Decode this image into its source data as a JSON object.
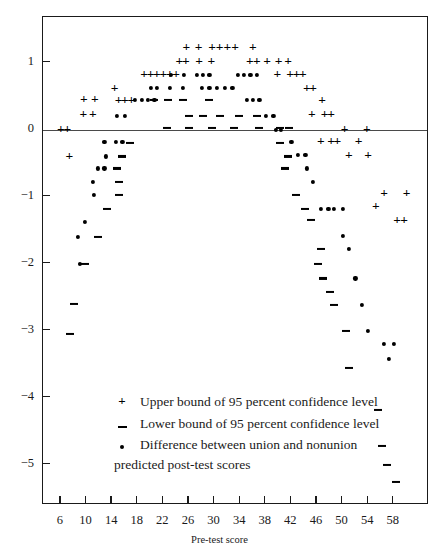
{
  "chart_data": {
    "type": "scatter",
    "title": "",
    "xlabel": "Pre-test score",
    "ylabel": "",
    "xlim": [
      3.2,
      63.5
    ],
    "ylim": [
      -5.6,
      1.68
    ],
    "grid": false,
    "zero_line": true,
    "xticks": [
      6,
      10,
      14,
      18,
      22,
      26,
      30,
      34,
      38,
      42,
      46,
      50,
      54,
      58
    ],
    "yticks": [
      1,
      0,
      -1,
      -2,
      -3,
      -4,
      -5
    ],
    "ytick_labels": [
      "1",
      "0",
      "−1",
      "−2",
      "−3",
      "−4",
      "−5"
    ],
    "legend_position": "lower-center-inside",
    "series": [
      {
        "name": "Upper bound of 95 percent confidence level",
        "marker": "plus",
        "symbol": "+",
        "color": "#000000",
        "points": [
          [
            6.0,
            0.0
          ],
          [
            7.0,
            0.0
          ],
          [
            7.3,
            -0.4
          ],
          [
            9.5,
            0.22
          ],
          [
            11.0,
            0.22
          ],
          [
            9.6,
            0.45
          ],
          [
            11.3,
            0.45
          ],
          [
            14.4,
            0.62
          ],
          [
            15.0,
            0.44
          ],
          [
            16.0,
            0.44
          ],
          [
            17.0,
            0.44
          ],
          [
            19.0,
            0.82
          ],
          [
            20.0,
            0.82
          ],
          [
            21.0,
            0.82
          ],
          [
            22.0,
            0.82
          ],
          [
            23.0,
            0.82
          ],
          [
            24.0,
            0.82
          ],
          [
            24.5,
            1.02
          ],
          [
            25.5,
            1.02
          ],
          [
            25.6,
            1.23
          ],
          [
            27.5,
            1.23
          ],
          [
            27.6,
            1.02
          ],
          [
            29.5,
            1.02
          ],
          [
            29.6,
            1.23
          ],
          [
            30.8,
            1.23
          ],
          [
            32.0,
            1.23
          ],
          [
            33.2,
            1.23
          ],
          [
            36.0,
            1.23
          ],
          [
            35.5,
            1.02
          ],
          [
            36.6,
            1.02
          ],
          [
            38.2,
            1.02
          ],
          [
            40.0,
            1.02
          ],
          [
            41.5,
            1.02
          ],
          [
            39.8,
            0.82
          ],
          [
            41.8,
            0.82
          ],
          [
            42.8,
            0.82
          ],
          [
            43.8,
            0.82
          ],
          [
            44.4,
            0.62
          ],
          [
            45.4,
            0.62
          ],
          [
            46.8,
            0.44
          ],
          [
            45.2,
            0.22
          ],
          [
            47.2,
            0.22
          ],
          [
            48.2,
            0.22
          ],
          [
            50.3,
            0.0
          ],
          [
            53.8,
            0.0
          ],
          [
            46.6,
            -0.18
          ],
          [
            48.2,
            -0.18
          ],
          [
            49.2,
            -0.18
          ],
          [
            51.0,
            -0.38
          ],
          [
            54.0,
            -0.38
          ],
          [
            56.5,
            -0.95
          ],
          [
            60.0,
            -0.95
          ],
          [
            55.2,
            -1.15
          ],
          [
            58.5,
            -1.35
          ],
          [
            59.6,
            -1.35
          ],
          [
            52.5,
            -0.18
          ]
        ]
      },
      {
        "name": "Lower bound of 95 percent confidence level",
        "marker": "dash",
        "symbol": "–",
        "color": "#000000",
        "points": [
          [
            20.5,
            0.44
          ],
          [
            22.8,
            0.44
          ],
          [
            25.0,
            0.44
          ],
          [
            29.2,
            0.44
          ],
          [
            26.0,
            0.21
          ],
          [
            28.2,
            0.21
          ],
          [
            30.8,
            0.21
          ],
          [
            33.8,
            0.21
          ],
          [
            36.6,
            0.21
          ],
          [
            22.5,
            0.02
          ],
          [
            26.0,
            0.02
          ],
          [
            29.6,
            0.02
          ],
          [
            33.0,
            0.02
          ],
          [
            37.0,
            0.02
          ],
          [
            40.2,
            0.02
          ],
          [
            41.6,
            0.02
          ],
          [
            16.8,
            -0.2
          ],
          [
            40.2,
            -0.2
          ],
          [
            15.6,
            -0.4
          ],
          [
            41.4,
            -0.4
          ],
          [
            14.8,
            -0.58
          ],
          [
            41.0,
            -0.58
          ],
          [
            15.0,
            -0.78
          ],
          [
            15.0,
            -0.98
          ],
          [
            42.8,
            -0.98
          ],
          [
            13.2,
            -1.18
          ],
          [
            44.2,
            -1.18
          ],
          [
            11.8,
            -1.6
          ],
          [
            45.0,
            -1.35
          ],
          [
            9.8,
            -2.0
          ],
          [
            46.6,
            -1.78
          ],
          [
            8.0,
            -2.6
          ],
          [
            46.2,
            -2.0
          ],
          [
            7.4,
            -3.05
          ],
          [
            47.0,
            -2.22
          ],
          [
            48.0,
            -2.42
          ],
          [
            48.6,
            -2.62
          ],
          [
            50.6,
            -3.0
          ],
          [
            51.0,
            -3.55
          ],
          [
            55.5,
            -4.18
          ],
          [
            56.2,
            -4.72
          ],
          [
            57.0,
            -5.0
          ],
          [
            58.4,
            -5.25
          ]
        ]
      },
      {
        "name": "Difference between union and nonunion predicted post-test scores",
        "marker": "dot",
        "symbol": "•",
        "color": "#000000",
        "points": [
          [
            14.8,
            0.21
          ],
          [
            16.0,
            0.21
          ],
          [
            17.6,
            0.44
          ],
          [
            18.6,
            0.44
          ],
          [
            19.6,
            0.44
          ],
          [
            20.6,
            0.44
          ],
          [
            20.0,
            0.62
          ],
          [
            21.0,
            0.62
          ],
          [
            23.0,
            0.62
          ],
          [
            25.0,
            0.62
          ],
          [
            23.2,
            0.82
          ],
          [
            25.2,
            0.82
          ],
          [
            27.2,
            0.82
          ],
          [
            28.2,
            0.82
          ],
          [
            29.2,
            0.82
          ],
          [
            28.0,
            0.62
          ],
          [
            29.2,
            0.62
          ],
          [
            30.4,
            0.62
          ],
          [
            31.6,
            0.62
          ],
          [
            32.8,
            0.62
          ],
          [
            33.6,
            0.82
          ],
          [
            34.6,
            0.82
          ],
          [
            35.6,
            0.82
          ],
          [
            36.6,
            0.82
          ],
          [
            35.0,
            0.44
          ],
          [
            36.0,
            0.44
          ],
          [
            37.0,
            0.44
          ],
          [
            38.0,
            0.21
          ],
          [
            39.2,
            0.21
          ],
          [
            39.6,
            0.0
          ],
          [
            40.4,
            0.0
          ],
          [
            12.8,
            -0.18
          ],
          [
            14.6,
            -0.18
          ],
          [
            15.6,
            -0.18
          ],
          [
            13.0,
            -0.4
          ],
          [
            42.0,
            -0.18
          ],
          [
            11.8,
            -0.58
          ],
          [
            12.8,
            -0.58
          ],
          [
            11.0,
            -0.78
          ],
          [
            43.0,
            -0.38
          ],
          [
            44.2,
            -0.38
          ],
          [
            11.2,
            -0.98
          ],
          [
            44.4,
            -0.58
          ],
          [
            9.8,
            -1.38
          ],
          [
            45.4,
            -0.78
          ],
          [
            8.6,
            -1.6
          ],
          [
            46.6,
            -1.18
          ],
          [
            47.8,
            -1.18
          ],
          [
            48.6,
            -1.18
          ],
          [
            50.0,
            -1.18
          ],
          [
            9.0,
            -2.0
          ],
          [
            50.0,
            -1.58
          ],
          [
            51.0,
            -1.78
          ],
          [
            52.0,
            -2.22
          ],
          [
            53.0,
            -2.62
          ],
          [
            54.0,
            -3.0
          ],
          [
            56.5,
            -3.2
          ],
          [
            58.0,
            -3.2
          ],
          [
            57.2,
            -3.42
          ]
        ]
      }
    ]
  },
  "legend": {
    "items": [
      {
        "symbol": "+",
        "label": "Upper bound of 95 percent confidence level"
      },
      {
        "symbol": "–",
        "label": "Lower bound of 95 percent confidence level"
      },
      {
        "symbol": "•",
        "label": "Difference between union and nonunion predicted post-test scores"
      }
    ]
  },
  "axis": {
    "x_title": "Pre-test score"
  }
}
